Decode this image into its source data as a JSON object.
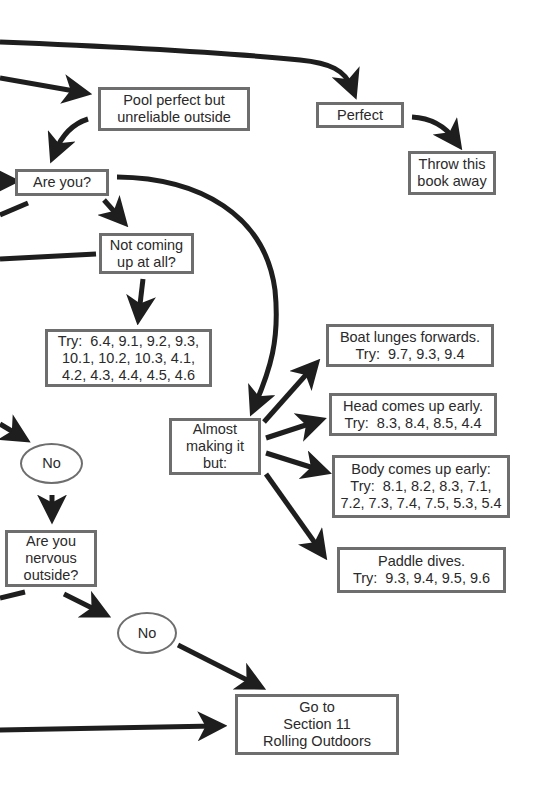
{
  "diagram": {
    "type": "flowchart",
    "theme": {
      "box_border": "#6e6e6e",
      "arrow": "#1e1e1e",
      "text": "#2a2a2a",
      "background": "#ffffff"
    },
    "nodes": {
      "pool_perfect": {
        "lines": [
          "Pool perfect but",
          "unreliable outside"
        ]
      },
      "perfect": {
        "lines": [
          "Perfect"
        ]
      },
      "throw_away": {
        "lines": [
          "Throw this",
          "book away"
        ]
      },
      "are_you": {
        "lines": [
          "Are you?"
        ]
      },
      "not_coming_up": {
        "lines": [
          "Not coming",
          "up at all?"
        ]
      },
      "try_not_coming_up": {
        "try_label": "Try:",
        "lines": [
          "6.4, 9.1, 9.2, 9.3,",
          "10.1, 10.2, 10.3, 4.1,",
          "4.2, 4.3, 4.4, 4.5, 4.6"
        ]
      },
      "almost": {
        "lines": [
          "Almost",
          "making it",
          "but:"
        ]
      },
      "boat_lunges": {
        "title": "Boat lunges forwards.",
        "try_label": "Try:",
        "values": "9.7, 9.3, 9.4"
      },
      "head_up": {
        "title": "Head comes up early.",
        "try_label": "Try:",
        "values": "8.3, 8.4, 8.5, 4.4"
      },
      "body_up": {
        "title": "Body comes up early:",
        "try_label": "Try:",
        "values": "8.1, 8.2, 8.3, 7.1,",
        "values2": "7.2, 7.3, 7.4, 7.5, 5.3, 5.4"
      },
      "paddle_dives": {
        "title": "Paddle dives.",
        "try_label": "Try:",
        "values": "9.3, 9.4, 9.5, 9.6"
      },
      "no_1": {
        "lines": [
          "No"
        ]
      },
      "nervous": {
        "lines": [
          "Are you",
          "nervous",
          "outside?"
        ]
      },
      "no_2": {
        "lines": [
          "No"
        ]
      },
      "go_to_section": {
        "lines": [
          "Go to",
          "Section 11",
          "Rolling Outdoors"
        ]
      }
    }
  }
}
